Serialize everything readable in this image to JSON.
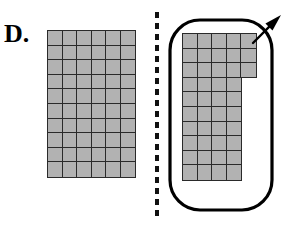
{
  "figure": {
    "panel_label": "D.",
    "background_color": "#ffffff",
    "cell_fill_color": "#b2b2b2",
    "cell_border_color": "#2a2a2a",
    "outline_color": "#000000",
    "divider_color": "#111111"
  },
  "left_grid": {
    "name": "full-rectangle-array",
    "columns": 6,
    "rows": 10,
    "total_squares": 60,
    "cell_size_px": 16.2,
    "origin_x_px": 47,
    "origin_y_px": 30,
    "row_lengths": [
      6,
      6,
      6,
      6,
      6,
      6,
      6,
      6,
      6,
      6
    ]
  },
  "right_grid": {
    "name": "l-shaped-array",
    "rows": 10,
    "max_columns": 5,
    "total_squares": 43,
    "cell_size_px": 16.2,
    "origin_x_px": 182,
    "origin_y_px": 33,
    "row_lengths": [
      5,
      5,
      5,
      4,
      4,
      4,
      4,
      4,
      4,
      4
    ]
  },
  "divider": {
    "name": "dashed-separator",
    "orientation": "vertical",
    "x_px": 157,
    "y_start_px": 12,
    "y_end_px": 216,
    "dash_length_px": 6,
    "gap_length_px": 5,
    "stroke_width_px": 4
  },
  "enclosure": {
    "name": "rounded-rectangle-outline",
    "x_px": 170,
    "y_px": 20,
    "width_px": 102,
    "height_px": 190,
    "corner_radius_px": 30,
    "stroke_width_px": 3.2
  },
  "arrow": {
    "name": "pointer-arrow",
    "direction": "up-right",
    "tail_x_px": 253,
    "tail_y_px": 43,
    "tip_x_px": 281,
    "tip_y_px": 15,
    "stroke_width_px": 2.4
  }
}
